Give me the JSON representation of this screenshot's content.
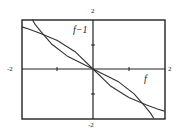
{
  "chart_data": {
    "type": "line",
    "title": "",
    "xlabel": "",
    "ylabel": "",
    "xlim": [
      -2,
      2
    ],
    "ylim": [
      -2,
      2
    ],
    "tick_labels": {
      "top": "2",
      "bottom": "-2",
      "left": "-2",
      "right": "2"
    },
    "grid": false,
    "series": [
      {
        "name": "f",
        "label": "f",
        "description": "decreasing curve through origin, flattening toward y=-1.7 at x=2",
        "x": [
          -2,
          -1.8,
          -1.5,
          -1,
          -0.5,
          0,
          0.5,
          1,
          1.5,
          1.8,
          2
        ],
        "y": [
          1.7,
          1.62,
          1.45,
          1.15,
          0.7,
          0,
          -0.7,
          -1.15,
          -1.45,
          -1.62,
          -1.7
        ]
      },
      {
        "name": "f-1",
        "label": "f−1",
        "description": "inverse of f, reflection across y=x",
        "x": [
          1.7,
          1.62,
          1.45,
          1.15,
          0.7,
          0,
          -0.7,
          -1.15,
          -1.45,
          -1.62,
          -1.7
        ],
        "y": [
          -2,
          -1.8,
          -1.5,
          -1,
          -0.5,
          0,
          0.5,
          1,
          1.5,
          1.8,
          2
        ]
      }
    ]
  },
  "labels": {
    "top": "2",
    "bottom": "-2",
    "left": "-2",
    "right": "2",
    "f": "f",
    "finv": "f−1"
  }
}
